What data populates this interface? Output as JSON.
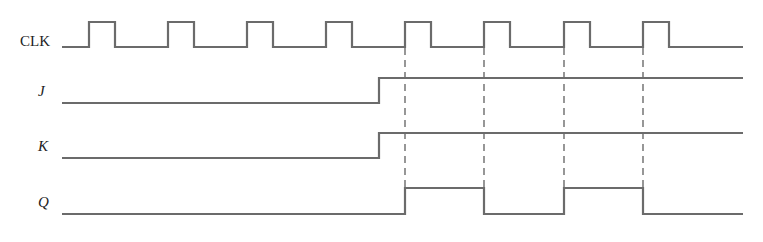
{
  "diagram": {
    "type": "timing-diagram",
    "signals": [
      {
        "name": "CLK",
        "label": "CLK",
        "italic": false,
        "low_y": 47,
        "high_y": 22,
        "label_y": 46,
        "start_x": 62,
        "end_x": 743,
        "pulses": [
          [
            89,
            115
          ],
          [
            168,
            194
          ],
          [
            247,
            273
          ],
          [
            326,
            352
          ],
          [
            405,
            431
          ],
          [
            484,
            510
          ],
          [
            564,
            590
          ],
          [
            643,
            669
          ]
        ]
      },
      {
        "name": "J",
        "label": "J",
        "italic": true,
        "low_y": 103,
        "high_y": 78,
        "label_y": 96,
        "start_x": 62,
        "end_x": 743,
        "initial": 0,
        "transitions": [
          379
        ]
      },
      {
        "name": "K",
        "label": "K",
        "italic": true,
        "low_y": 158,
        "high_y": 133,
        "label_y": 151,
        "start_x": 62,
        "end_x": 743,
        "initial": 0,
        "transitions": [
          379
        ]
      },
      {
        "name": "Q",
        "label": "Q",
        "italic": true,
        "low_y": 214,
        "high_y": 188,
        "label_y": 207,
        "start_x": 62,
        "end_x": 743,
        "initial": 0,
        "transitions": [
          405,
          484,
          564,
          643
        ]
      }
    ],
    "dashed_markers": {
      "x": [
        405,
        484,
        564,
        643
      ],
      "y_top": 48,
      "y_bottom": 188
    }
  }
}
